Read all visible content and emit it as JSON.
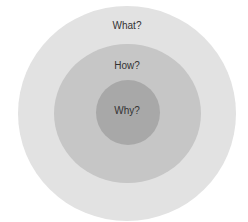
{
  "diagram": {
    "type": "concentric-circles",
    "rings": [
      {
        "label": "What?",
        "color": "#e2e2e2"
      },
      {
        "label": "How?",
        "color": "#c6c6c6"
      },
      {
        "label": "Why?",
        "color": "#a8a8a8"
      }
    ]
  }
}
